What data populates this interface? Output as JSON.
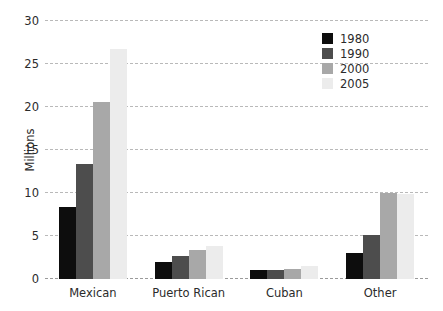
{
  "chart_data": {
    "type": "bar",
    "title": "",
    "subtitle": "",
    "xlabel": "",
    "ylabel": "Millions",
    "categories": [
      "Mexican",
      "Puerto Rican",
      "Cuban",
      "Other"
    ],
    "series": [
      {
        "name": "1980",
        "color": "#0d0d0d",
        "values": [
          8.4,
          2.0,
          1.0,
          3.0
        ]
      },
      {
        "name": "1990",
        "color": "#4d4d4d",
        "values": [
          13.4,
          2.7,
          1.1,
          5.1
        ]
      },
      {
        "name": "2000",
        "color": "#a8a8a8",
        "values": [
          20.6,
          3.4,
          1.2,
          10.0
        ]
      },
      {
        "name": "2005",
        "color": "#ececec",
        "values": [
          26.8,
          3.8,
          1.5,
          9.9
        ]
      }
    ],
    "ylim": [
      0,
      30
    ],
    "yticks": [
      0,
      5,
      10,
      15,
      20,
      25,
      30
    ],
    "ytick_labels": [
      "0",
      "5",
      "10",
      "15",
      "20",
      "25",
      "30"
    ],
    "grid": true,
    "grid_style": "dashed-horizontal",
    "grid_color": "#b9b9b9",
    "legend_position": "top-right",
    "background_color": "#ffffff",
    "text_color": "#2b2b2b"
  }
}
